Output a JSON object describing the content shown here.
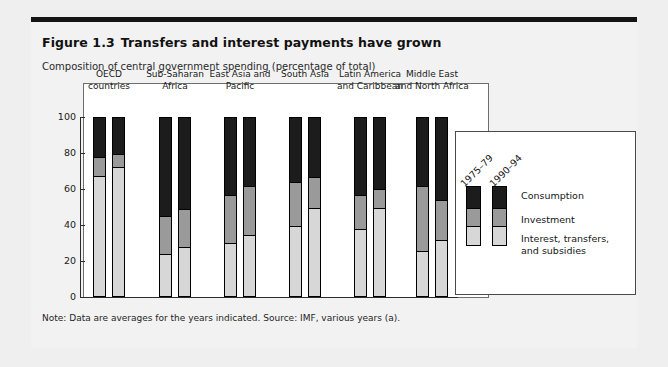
{
  "figure": {
    "number": "Figure 1.3",
    "title": "Transfers and interest payments have grown",
    "subtitle": "Composition of central government spending (percentage of total)",
    "note": "Note: Data are averages for the years indicated. Source: IMF, various years (a)."
  },
  "legend": {
    "year_labels": [
      "1975–79",
      "1990–94"
    ],
    "entries": [
      {
        "label": "Consumption",
        "color": "#1c1c1c"
      },
      {
        "label": "Investment",
        "color": "#9a9a9a"
      },
      {
        "label": "Interest, transfers,\nand subsidies",
        "color": "#d7d7d7"
      }
    ]
  },
  "axis": {
    "yticks": [
      "0",
      "20",
      "40",
      "60",
      "80",
      "100"
    ]
  },
  "colors": {
    "consumption": "#1c1c1c",
    "investment": "#9a9a9a",
    "interest": "#d7d7d7",
    "page_background": "#efefef",
    "panel_background": "#f2f2f2",
    "rule": "#141414"
  },
  "chart_data": {
    "type": "bar",
    "subtype": "stacked-column, grouped by period",
    "title": "Transfers and interest payments have grown",
    "subtitle": "Composition of central government spending (percentage of total)",
    "xlabel": "",
    "ylabel": "",
    "ylim": [
      0,
      100
    ],
    "yticks": [
      0,
      20,
      40,
      60,
      80,
      100
    ],
    "grid": false,
    "legend_position": "right",
    "stack_order_bottom_to_top": [
      "Interest, transfers, and subsidies",
      "Investment",
      "Consumption"
    ],
    "categories": [
      "OECD countries",
      "Sub-Saharan Africa",
      "East Asia and Pacific",
      "South Asia",
      "Latin America and Caribbean",
      "Middle East and North Africa"
    ],
    "periods": [
      "1975–79",
      "1990–94"
    ],
    "series": [
      {
        "name": "Interest, transfers, and subsidies",
        "color": "#d7d7d7",
        "values_1975_79": [
          67,
          23,
          29,
          39,
          37,
          25
        ],
        "values_1990_94": [
          72,
          27,
          34,
          49,
          49,
          31
        ]
      },
      {
        "name": "Investment",
        "color": "#9a9a9a",
        "values_1975_79": [
          11,
          22,
          28,
          25,
          20,
          37
        ],
        "values_1990_94": [
          8,
          22,
          28,
          18,
          11,
          23
        ]
      },
      {
        "name": "Consumption",
        "color": "#1c1c1c",
        "values_1975_79": [
          22,
          55,
          43,
          36,
          43,
          38
        ],
        "values_1990_94": [
          20,
          51,
          38,
          33,
          40,
          46
        ]
      }
    ],
    "cumulative_tops": {
      "1975_79": {
        "interest_top": [
          67,
          23,
          29,
          39,
          37,
          25
        ],
        "investment_top": [
          78,
          45,
          57,
          64,
          57,
          62
        ],
        "consumption_top": [
          100,
          100,
          100,
          100,
          100,
          100
        ]
      },
      "1990_94": {
        "interest_top": [
          72,
          27,
          34,
          49,
          49,
          31
        ],
        "investment_top": [
          80,
          49,
          62,
          67,
          60,
          54
        ],
        "consumption_top": [
          100,
          100,
          100,
          100,
          100,
          100
        ]
      }
    }
  }
}
